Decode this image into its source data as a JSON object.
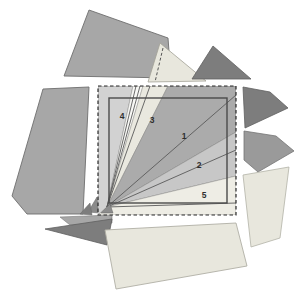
{
  "figure": {
    "regions": [
      {
        "label": "1"
      },
      {
        "label": "2"
      },
      {
        "label": "3"
      },
      {
        "label": "4"
      },
      {
        "label": "5"
      }
    ],
    "palette": {
      "background": "#ffffff",
      "baseFill": "#f5f4ee",
      "sector1": "#ababab",
      "sector2": "#c7c7c7",
      "sector3": "#e9e8df",
      "sector4": "#d2d2d2",
      "sector5": "#eeede5",
      "whiteBand": "#f8f8f5",
      "outerGray": "#a7a7a7",
      "outerDark": "#7d7d7d",
      "outerMidDark": "#9a9a9a",
      "outerCream": "#e8e7dd",
      "lineColor": "#5a5a5a",
      "squareBorder": "#4a4a4a",
      "dashedBorder": "#2b2b2b"
    }
  }
}
